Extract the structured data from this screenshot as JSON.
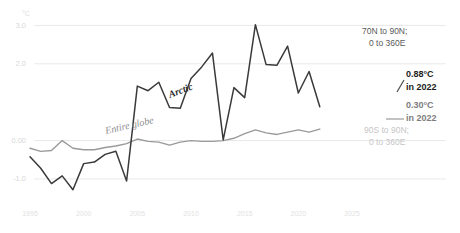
{
  "chart_data": {
    "type": "line",
    "title": "",
    "xlabel": "",
    "ylabel": "",
    "unit_label": "°C",
    "grid": true,
    "legend_position": "inline",
    "xlim": [
      1995,
      2025
    ],
    "ylim": [
      -1.6,
      3.35
    ],
    "x_ticks": [
      1995,
      2000,
      2005,
      2010,
      2015,
      2020,
      2025
    ],
    "x_tick_labels": [
      "1995",
      "2000",
      "2005",
      "2010",
      "2015",
      "2020",
      "2025"
    ],
    "y_ticks": [
      3.0,
      2.0,
      0.0,
      -1.0
    ],
    "y_tick_labels": [
      "3.0",
      "2.0",
      "0.00",
      "-1.0"
    ],
    "x": [
      1995,
      1996,
      1997,
      1998,
      1999,
      2000,
      2001,
      2002,
      2003,
      2004,
      2005,
      2006,
      2007,
      2008,
      2009,
      2010,
      2011,
      2012,
      2013,
      2014,
      2015,
      2016,
      2017,
      2018,
      2019,
      2020,
      2021,
      2022
    ],
    "series": [
      {
        "name": "Arctic",
        "region": "70N to 90N; 0 to 360E",
        "color": "#3a3a3a",
        "end_value_label": "0.88°C",
        "end_year_label": "in 2022",
        "values": [
          -0.42,
          -0.72,
          -1.12,
          -0.92,
          -1.28,
          -0.6,
          -0.56,
          -0.36,
          -0.28,
          -1.05,
          1.42,
          1.3,
          1.52,
          0.86,
          0.84,
          1.62,
          1.92,
          2.28,
          0.02,
          1.38,
          1.12,
          3.02,
          1.98,
          1.96,
          2.46,
          1.24,
          1.8,
          0.88
        ]
      },
      {
        "name": "Entire globe",
        "region": "90S to 90N; 0 to 360E",
        "color": "#9a9a9a",
        "end_value_label": "0.30°C",
        "end_year_label": "in 2022",
        "values": [
          -0.2,
          -0.28,
          -0.26,
          0.0,
          -0.2,
          -0.24,
          -0.24,
          -0.18,
          -0.14,
          -0.08,
          0.04,
          -0.02,
          -0.04,
          -0.12,
          -0.04,
          0.0,
          -0.02,
          -0.02,
          0.0,
          0.06,
          0.18,
          0.28,
          0.2,
          0.16,
          0.22,
          0.28,
          0.22,
          0.3
        ]
      }
    ],
    "inline_labels": [
      {
        "name": "arctic-series-label",
        "text": "Arctic"
      },
      {
        "name": "globe-series-label",
        "text": "Entire globe"
      }
    ],
    "annotations": {
      "arctic_region": {
        "line1": "70N to 90N;",
        "line2": "0 to 360E"
      },
      "arctic_value": {
        "line1": "0.88°C",
        "line2": "in 2022"
      },
      "globe_value": {
        "line1": "0.30°C",
        "line2": "in 2022"
      },
      "globe_region": {
        "line1": "90S to 90N;",
        "line2": "0 to 360E"
      }
    },
    "colors": {
      "arctic": "#3a3a3a",
      "globe": "#9a9a9a",
      "grid": "#e9e9e9",
      "background": "#ffffff"
    }
  }
}
